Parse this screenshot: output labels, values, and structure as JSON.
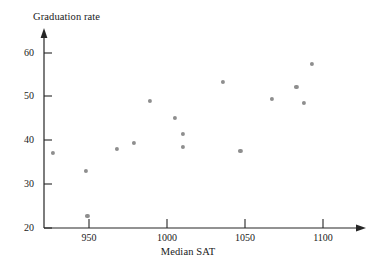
{
  "chart_data": {
    "type": "scatter",
    "title": "",
    "xlabel": "Median SAT",
    "ylabel": "Graduation rate",
    "xlim": [
      920,
      1110
    ],
    "ylim": [
      20,
      63
    ],
    "grid": false,
    "legend": "none",
    "xticks": [
      950,
      1000,
      1050,
      1100
    ],
    "xtick_labels": [
      "950",
      "1000",
      "1050",
      "1100"
    ],
    "yticks": [
      20,
      30,
      40,
      50,
      60
    ],
    "ytick_labels": [
      "20",
      "30",
      "40",
      "50",
      "60"
    ],
    "marker_color": "#8e8e8e",
    "axis_color": "#262626",
    "points": [
      {
        "x": 927,
        "y": 37.1
      },
      {
        "x": 948,
        "y": 33.0
      },
      {
        "x": 949,
        "y": 22.7
      },
      {
        "x": 968,
        "y": 38.1
      },
      {
        "x": 979,
        "y": 39.4
      },
      {
        "x": 989,
        "y": 49.0
      },
      {
        "x": 1005,
        "y": 45.1
      },
      {
        "x": 1010,
        "y": 41.5
      },
      {
        "x": 1010,
        "y": 38.5
      },
      {
        "x": 1036,
        "y": 53.4
      },
      {
        "x": 1047,
        "y": 37.6
      },
      {
        "x": 1067,
        "y": 49.5
      },
      {
        "x": 1083,
        "y": 52.2
      },
      {
        "x": 1088,
        "y": 48.6
      },
      {
        "x": 1093,
        "y": 57.5
      }
    ]
  },
  "labels": {
    "y_axis_title": "Graduation rate",
    "x_axis_title": "Median SAT"
  }
}
